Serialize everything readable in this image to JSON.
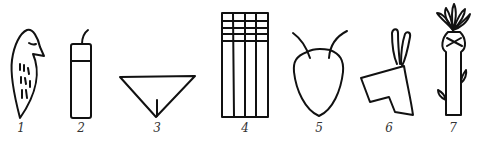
{
  "figure": {
    "stroke_color": "#111111",
    "background": "#ffffff",
    "glyphs": [
      {
        "number": "1",
        "depicts": "bird"
      },
      {
        "number": "2",
        "depicts": "vessel-with-spout"
      },
      {
        "number": "3",
        "depicts": "triangle"
      },
      {
        "number": "4",
        "depicts": "grid"
      },
      {
        "number": "5",
        "depicts": "head-with-antennae"
      },
      {
        "number": "6",
        "depicts": "animal-head-with-ears"
      },
      {
        "number": "7",
        "depicts": "plant-stalk"
      }
    ]
  }
}
